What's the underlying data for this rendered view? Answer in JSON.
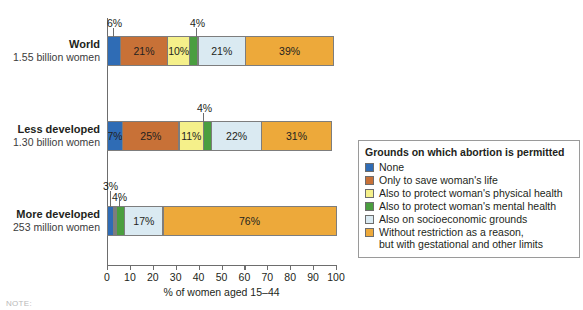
{
  "chart_data": {
    "type": "bar",
    "orientation": "horizontal",
    "stacked": true,
    "title": "",
    "xlabel": "% of women aged 15–44",
    "ylabel": "",
    "xlim": [
      0,
      100
    ],
    "grid": false,
    "legend_position": "right",
    "legend_title": "Grounds on which abortion is permitted",
    "categories": [
      "World",
      "Less developed",
      "More developed"
    ],
    "category_sublabels": [
      "1.55 billion women",
      "1.30 billion women",
      "253 million women"
    ],
    "series": [
      {
        "name": "None",
        "color": "#2f6cb5",
        "values": [
          6,
          7,
          3
        ]
      },
      {
        "name": "Only to save woman's life",
        "color": "#c87137",
        "values": [
          21,
          25,
          1
        ]
      },
      {
        "name": "Also to protect woman's physical health",
        "color": "#f5f08a",
        "values": [
          10,
          11,
          1
        ]
      },
      {
        "name": "Also to protect woman's mental health",
        "color": "#4a9e3f",
        "values": [
          4,
          4,
          4
        ]
      },
      {
        "name": "Also on socioeconomic grounds",
        "color": "#daeaf2",
        "values": [
          21,
          22,
          17
        ]
      },
      {
        "name": "Without restriction as a reason, but with gestational and other limits",
        "color": "#eda93a",
        "values": [
          39,
          31,
          76
        ]
      }
    ],
    "tick_values": [
      0,
      10,
      20,
      30,
      40,
      50,
      60,
      70,
      80,
      90,
      100
    ],
    "tick_labels": [
      "0",
      "10",
      "20",
      "30",
      "40",
      "50",
      "60",
      "70",
      "80",
      "90",
      "100"
    ],
    "bars": [
      {
        "category": "World",
        "sublabel": "1.55 billion women",
        "segments": [
          {
            "series": "None",
            "value": 6,
            "label": "6%",
            "label_placement": "callout-above"
          },
          {
            "series": "Only to save woman's life",
            "value": 21,
            "label": "21%",
            "label_placement": "inside"
          },
          {
            "series": "Also to protect woman's physical health",
            "value": 10,
            "label": "10%",
            "label_placement": "inside"
          },
          {
            "series": "Also to protect woman's mental health",
            "value": 4,
            "label": "4%",
            "label_placement": "callout-above"
          },
          {
            "series": "Also on socioeconomic grounds",
            "value": 21,
            "label": "21%",
            "label_placement": "inside"
          },
          {
            "series": "Without restriction as a reason, but with gestational and other limits",
            "value": 39,
            "label": "39%",
            "label_placement": "inside"
          }
        ]
      },
      {
        "category": "Less developed",
        "sublabel": "1.30 billion women",
        "segments": [
          {
            "series": "None",
            "value": 7,
            "label": "7%",
            "label_placement": "inside"
          },
          {
            "series": "Only to save woman's life",
            "value": 25,
            "label": "25%",
            "label_placement": "inside"
          },
          {
            "series": "Also to protect woman's physical health",
            "value": 11,
            "label": "11%",
            "label_placement": "inside"
          },
          {
            "series": "Also to protect woman's mental health",
            "value": 4,
            "label": "4%",
            "label_placement": "callout-above"
          },
          {
            "series": "Also on socioeconomic grounds",
            "value": 22,
            "label": "22%",
            "label_placement": "inside"
          },
          {
            "series": "Without restriction as a reason, but with gestational and other limits",
            "value": 31,
            "label": "31%",
            "label_placement": "inside"
          }
        ]
      },
      {
        "category": "More developed",
        "sublabel": "253 million women",
        "segments": [
          {
            "series": "None",
            "value": 3,
            "label": "3%",
            "label_placement": "callout-above"
          },
          {
            "series": "Only to save woman's life",
            "value": 1,
            "label": "",
            "label_placement": "none"
          },
          {
            "series": "Also to protect woman's physical health",
            "value": 1,
            "label": "",
            "label_placement": "none"
          },
          {
            "series": "Also to protect woman's mental health",
            "value": 4,
            "label": "4%",
            "label_placement": "callout-above"
          },
          {
            "series": "Also on socioeconomic grounds",
            "value": 17,
            "label": "17%",
            "label_placement": "inside"
          },
          {
            "series": "Without restriction as a reason, but with gestational and other limits",
            "value": 76,
            "label": "76%",
            "label_placement": "inside"
          }
        ]
      }
    ]
  },
  "legend": {
    "title": "Grounds on which abortion is permitted",
    "items": [
      {
        "label": "None",
        "label2": "",
        "color": "#2f6cb5"
      },
      {
        "label": "Only to save woman's life",
        "label2": "",
        "color": "#c87137"
      },
      {
        "label": "Also to protect woman's physical health",
        "label2": "",
        "color": "#f5f08a"
      },
      {
        "label": "Also to protect woman's mental health",
        "label2": "",
        "color": "#4a9e3f"
      },
      {
        "label": "Also on socioeconomic grounds",
        "label2": "",
        "color": "#daeaf2"
      },
      {
        "label": "Without restriction as a reason,",
        "label2": "but with gestational and other limits",
        "color": "#eda93a"
      }
    ]
  },
  "axis": {
    "xlabel": "% of women aged 15–44",
    "ticks": [
      "0",
      "10",
      "20",
      "30",
      "40",
      "50",
      "60",
      "70",
      "80",
      "90",
      "100"
    ]
  },
  "callouts": {
    "world_none": "6%",
    "world_mental": "4%",
    "less_mental": "4%",
    "more_none": "3%",
    "more_mental": "4%"
  },
  "footer": {
    "note": "NOTE:"
  }
}
